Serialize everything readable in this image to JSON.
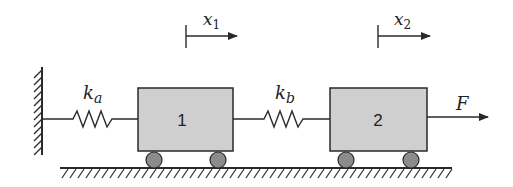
{
  "diagram": {
    "type": "two-mass spring system",
    "colors": {
      "stroke": "#2a2a2a",
      "block_fill": "#cfcfcf",
      "wheel_fill": "#8c8c8c"
    },
    "labels": {
      "spring_a_main": "k",
      "spring_a_sub": "a",
      "spring_b_main": "k",
      "spring_b_sub": "b",
      "block1": "1",
      "block2": "2",
      "disp1_main": "x",
      "disp1_sub": "1",
      "disp2_main": "x",
      "disp2_sub": "2",
      "force": "F"
    }
  }
}
